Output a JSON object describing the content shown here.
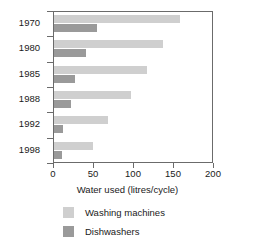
{
  "chart_data": {
    "type": "bar",
    "orientation": "horizontal",
    "title": "",
    "xlabel": "Water used (litres/cycle)",
    "ylabel": "",
    "categories": [
      "1970",
      "1980",
      "1985",
      "1988",
      "1992",
      "1998"
    ],
    "xlim": [
      0,
      200
    ],
    "xticks": [
      0,
      50,
      100,
      150,
      200
    ],
    "xtick_labels": [
      "0",
      "50",
      "100",
      "150",
      "200"
    ],
    "grid": false,
    "legend_position": "bottom",
    "series": [
      {
        "name": "Washing machines",
        "color": "#cfcfcf",
        "values": [
          160,
          138,
          118,
          97,
          68,
          49
        ]
      },
      {
        "name": "Dishwashers",
        "color": "#9a9a9a",
        "values": [
          55,
          40,
          27,
          22,
          11,
          10
        ]
      }
    ]
  },
  "legend": {
    "items": [
      {
        "label": "Washing machines",
        "color": "#cfcfcf"
      },
      {
        "label": "Dishwashers",
        "color": "#9a9a9a"
      }
    ]
  },
  "axis": {
    "x_title": "Water used (litres/cycle)"
  }
}
